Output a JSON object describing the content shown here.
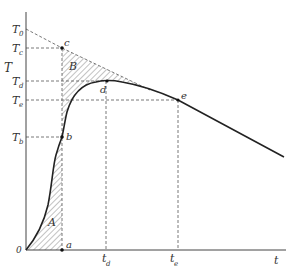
{
  "figure": {
    "axis_labels": {
      "y": "T",
      "x": "t",
      "origin": "0"
    },
    "y_ticks": [
      {
        "id": "T0",
        "base": "T",
        "sub": "0"
      },
      {
        "id": "Tc",
        "base": "T",
        "sub": "c"
      },
      {
        "id": "Td",
        "base": "T",
        "sub": "d"
      },
      {
        "id": "Te",
        "base": "T",
        "sub": "e"
      },
      {
        "id": "Tb",
        "base": "T",
        "sub": "b"
      }
    ],
    "x_ticks": [
      {
        "id": "td",
        "base": "t",
        "sub": "d"
      },
      {
        "id": "te",
        "base": "t",
        "sub": "e"
      }
    ],
    "points": {
      "a": "a",
      "b": "b",
      "c": "c",
      "d": "d",
      "e": "e"
    },
    "regions": {
      "A": "A",
      "B": "B"
    },
    "colors": {
      "curve": "#222222",
      "dashed": "#555555",
      "hatch": "#666666"
    }
  }
}
